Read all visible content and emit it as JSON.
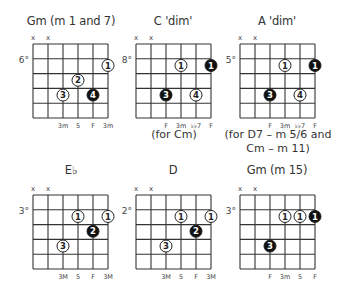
{
  "chords": [
    {
      "title": "Gm (m 1 and 7)",
      "position": "6°",
      "muted": [
        "x",
        "x"
      ],
      "dots": [
        {
          "string": 5,
          "fret": 1,
          "finger": "1",
          "filled": false
        },
        {
          "string": 3,
          "fret": 2,
          "finger": "2",
          "filled": false
        },
        {
          "string": 2,
          "fret": 3,
          "finger": "3",
          "filled": false
        },
        {
          "string": 4,
          "fret": 3,
          "finger": "4",
          "filled": true
        }
      ],
      "labels": [
        {
          "string": 2,
          "text": "3m"
        },
        {
          "string": 3,
          "text": "5"
        },
        {
          "string": 4,
          "text": "F"
        },
        {
          "string": 5,
          "text": "3m"
        }
      ],
      "note": ""
    },
    {
      "title": "C 'dim'",
      "position": "8°",
      "muted": [
        "x",
        "x"
      ],
      "dots": [
        {
          "string": 3,
          "fret": 1,
          "finger": "1",
          "filled": false
        },
        {
          "string": 5,
          "fret": 1,
          "finger": "1",
          "filled": true
        },
        {
          "string": 2,
          "fret": 3,
          "finger": "3",
          "filled": true
        },
        {
          "string": 4,
          "fret": 3,
          "finger": "4",
          "filled": false
        }
      ],
      "labels": [
        {
          "string": 2,
          "text": "F"
        },
        {
          "string": 3,
          "text": "3m"
        },
        {
          "string": 4,
          "text": "♭♭7"
        },
        {
          "string": 5,
          "text": "F"
        }
      ],
      "note": "(for Cm)"
    },
    {
      "title": "A 'dim'",
      "position": "5°",
      "muted": [
        "x",
        "x"
      ],
      "dots": [
        {
          "string": 3,
          "fret": 1,
          "finger": "1",
          "filled": false
        },
        {
          "string": 5,
          "fret": 1,
          "finger": "1",
          "filled": true
        },
        {
          "string": 2,
          "fret": 3,
          "finger": "3",
          "filled": true
        },
        {
          "string": 4,
          "fret": 3,
          "finger": "4",
          "filled": false
        }
      ],
      "labels": [
        {
          "string": 2,
          "text": "F"
        },
        {
          "string": 3,
          "text": "3m"
        },
        {
          "string": 4,
          "text": "♭♭7"
        },
        {
          "string": 5,
          "text": "F"
        }
      ],
      "note": "(for D7 – m 5/6 and",
      "note2": "Cm – m 11)"
    },
    {
      "title": "E♭",
      "position": "3°",
      "muted": [
        "x",
        "x"
      ],
      "dots": [
        {
          "string": 3,
          "fret": 1,
          "finger": "1",
          "filled": false
        },
        {
          "string": 5,
          "fret": 1,
          "finger": "1",
          "filled": false
        },
        {
          "string": 4,
          "fret": 2,
          "finger": "2",
          "filled": true
        },
        {
          "string": 2,
          "fret": 3,
          "finger": "3",
          "filled": false
        }
      ],
      "labels": [
        {
          "string": 2,
          "text": "3M"
        },
        {
          "string": 3,
          "text": "5"
        },
        {
          "string": 4,
          "text": "F"
        },
        {
          "string": 5,
          "text": "3M"
        }
      ],
      "note": ""
    },
    {
      "title": "D",
      "position": "2°",
      "muted": [
        "x",
        "x"
      ],
      "dots": [
        {
          "string": 3,
          "fret": 1,
          "finger": "1",
          "filled": false
        },
        {
          "string": 5,
          "fret": 1,
          "finger": "1",
          "filled": false
        },
        {
          "string": 4,
          "fret": 2,
          "finger": "2",
          "filled": true
        },
        {
          "string": 2,
          "fret": 3,
          "finger": "3",
          "filled": false
        }
      ],
      "labels": [
        {
          "string": 2,
          "text": "3M"
        },
        {
          "string": 3,
          "text": "5"
        },
        {
          "string": 4,
          "text": "F"
        },
        {
          "string": 5,
          "text": "3M"
        }
      ],
      "note": ""
    },
    {
      "title": "Gm (m 15)",
      "position": "3°",
      "muted": [
        "x",
        "x"
      ],
      "dots": [
        {
          "string": 3,
          "fret": 1,
          "finger": "1",
          "filled": false
        },
        {
          "string": 4,
          "fret": 1,
          "finger": "1",
          "filled": false
        },
        {
          "string": 5,
          "fret": 1,
          "finger": "1",
          "filled": true
        },
        {
          "string": 2,
          "fret": 3,
          "finger": "3",
          "filled": true
        }
      ],
      "labels": [
        {
          "string": 2,
          "text": "F"
        },
        {
          "string": 3,
          "text": "3m"
        },
        {
          "string": 4,
          "text": "5"
        },
        {
          "string": 5,
          "text": "F"
        }
      ],
      "note": ""
    }
  ]
}
